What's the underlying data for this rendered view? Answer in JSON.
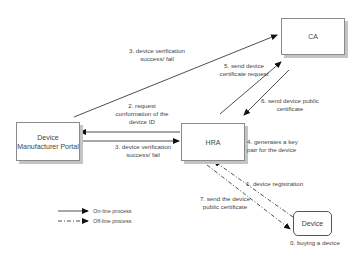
{
  "diagram": {
    "nodes": {
      "ca": {
        "label": "CA"
      },
      "dmp": {
        "label_line1": "Device",
        "label_line2": "Manufacturer Portal"
      },
      "hra": {
        "label": "HRA"
      },
      "device": {
        "label": "Device"
      }
    },
    "edges": {
      "e0": {
        "label": "0. buying a device"
      },
      "e1": {
        "label": "1. device registration",
        "style": "off-line"
      },
      "e2": {
        "line1": "2. request",
        "line2": "conformation of the",
        "line3": "device ID",
        "style": "on-line"
      },
      "e3a": {
        "line1": "3. device verification",
        "line2": "success/ fail",
        "style": "on-line"
      },
      "e3b": {
        "line1": "3. device verification",
        "line2": "success/ fail",
        "style": "on-line"
      },
      "e4": {
        "line1": "4. generates a key",
        "line2": "pair for the device"
      },
      "e5": {
        "line1": "5. send device",
        "line2": "certificate request",
        "style": "on-line"
      },
      "e6": {
        "line1": "6. send device public",
        "line2": "certificate",
        "style": "on-line"
      },
      "e7": {
        "line1": "7. send the device",
        "line2": "public certificate",
        "style": "off-line"
      }
    },
    "legend": {
      "online": "On-line process",
      "offline": "Off-line process"
    }
  }
}
